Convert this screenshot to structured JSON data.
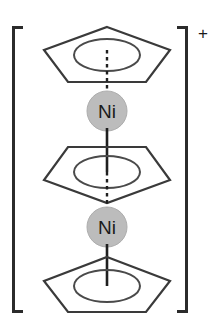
{
  "figure": {
    "name": "triple-decker-nickelocene-cation",
    "charge_label": "+",
    "bracket_left_glyph": "[",
    "bracket_right_glyph": "]",
    "background_color": "#ffffff",
    "stroke_color": "#2b2b2b",
    "metal_fill_color": "#bcbcbc",
    "metal_stroke_color": "#a6a6a6",
    "label_color": "#1a1a1a"
  },
  "metals": [
    {
      "id": "ni-top",
      "label": "Ni",
      "element_symbol": "Ni",
      "cx": 107,
      "cy": 111,
      "r": 20
    },
    {
      "id": "ni-bottom",
      "label": "Ni",
      "element_symbol": "Ni",
      "cx": 107,
      "cy": 227,
      "r": 20
    }
  ],
  "rings": [
    {
      "id": "cp-top",
      "name": "cyclopentadienyl-ring-top",
      "orientation": "apex-up",
      "cx": 107,
      "cy": 53,
      "ellipse_rx": 32,
      "ellipse_ry": 15
    },
    {
      "id": "cp-middle",
      "name": "cyclopentadienyl-ring-middle",
      "orientation": "apex-down",
      "cx": 107,
      "cy": 170,
      "ellipse_rx": 32,
      "ellipse_ry": 15
    },
    {
      "id": "cp-bottom",
      "name": "cyclopentadienyl-ring-bottom",
      "orientation": "apex-up",
      "cx": 107,
      "cy": 283,
      "ellipse_rx": 32,
      "ellipse_ry": 15
    }
  ],
  "bonds": [
    {
      "id": "bond-top-ring-to-ni-top",
      "style": "dashed",
      "x": 107,
      "y1": 53,
      "y2": 75
    },
    {
      "id": "bond-ni-top-to-mid-ring",
      "style": "solid",
      "x": 107,
      "y1": 131,
      "y2": 170
    },
    {
      "id": "bond-mid-ring-to-ni-bottom",
      "style": "dashed",
      "x": 107,
      "y1": 170,
      "y2": 207
    },
    {
      "id": "bond-ni-bottom-to-bottom-ring",
      "style": "solid",
      "x": 107,
      "y1": 247,
      "y2": 283
    }
  ],
  "brackets": {
    "left": {
      "x_spine": 13,
      "x_arm_end": 23,
      "y_top": 27,
      "y_bottom": 312
    },
    "right": {
      "x_spine": 187,
      "x_arm_end": 177,
      "y_top": 27,
      "y_bottom": 312
    }
  },
  "charge": {
    "symbol": "+",
    "x": 203,
    "y": 38
  }
}
